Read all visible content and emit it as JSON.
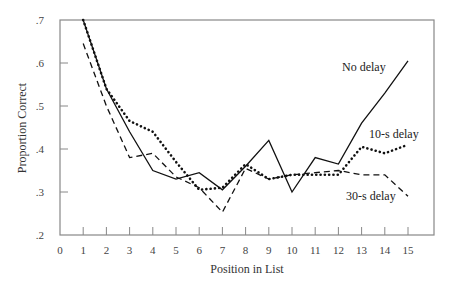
{
  "chart_data": {
    "type": "line",
    "title": "",
    "xlabel": "Position in List",
    "ylabel": "Proportion Correct",
    "xlim": [
      0,
      16
    ],
    "ylim": [
      0.2,
      0.7
    ],
    "grid": false,
    "legend_position": "inline labels at right",
    "x_ticks": [
      "0",
      "1",
      "2",
      "3",
      "4",
      "5",
      "6",
      "7",
      "8",
      "9",
      "10",
      "11",
      "12",
      "13",
      "14",
      "15"
    ],
    "y_ticks": [
      ".2",
      ".3",
      ".4",
      ".5",
      ".6",
      ".7"
    ],
    "x": [
      1,
      2,
      3,
      4,
      5,
      6,
      7,
      8,
      9,
      10,
      11,
      12,
      13,
      14,
      15
    ],
    "series": [
      {
        "name": "No delay",
        "style": "solid",
        "values": [
          0.7,
          0.54,
          0.44,
          0.35,
          0.33,
          0.345,
          0.305,
          0.36,
          0.42,
          0.3,
          0.38,
          0.365,
          0.46,
          0.53,
          0.605
        ]
      },
      {
        "name": "10-s delay",
        "style": "dotted",
        "values": [
          0.7,
          0.54,
          0.465,
          0.44,
          0.37,
          0.305,
          0.31,
          0.365,
          0.33,
          0.34,
          0.34,
          0.34,
          0.405,
          0.39,
          0.41
        ]
      },
      {
        "name": "30-s delay",
        "style": "dashed",
        "values": [
          0.645,
          0.5,
          0.38,
          0.39,
          0.335,
          0.31,
          0.253,
          0.355,
          0.33,
          0.34,
          0.345,
          0.35,
          0.34,
          0.34,
          0.29
        ]
      }
    ]
  },
  "labels": {
    "no_delay": "No delay",
    "ten_s_delay": "10-s delay",
    "thirty_s_delay": "30-s delay",
    "xlabel": "Position in List",
    "ylabel": "Proportion Correct"
  }
}
